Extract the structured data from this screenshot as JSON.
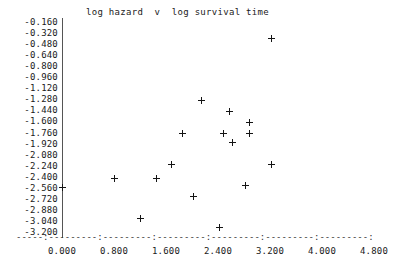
{
  "chart_data": {
    "type": "scatter",
    "title": "log hazard  v  log survival time",
    "xlabel": "",
    "ylabel": "",
    "xlim": [
      0.0,
      4.8
    ],
    "ylim": [
      -3.2,
      -0.16
    ],
    "grid": false,
    "legend": null,
    "marker": "plus",
    "x_ticks": [
      "0.000",
      "0.800",
      "1.600",
      "2.400",
      "3.200",
      "4.000",
      "4.800"
    ],
    "x_tick_values": [
      0.0,
      0.8,
      1.6,
      2.4,
      3.2,
      4.0,
      4.8
    ],
    "y_ticks": [
      "-0.160",
      "-0.320",
      "-0.480",
      "-0.640",
      "-0.800",
      "-0.960",
      "-1.120",
      "-1.280",
      "-1.440",
      "-1.600",
      "-1.760",
      "-1.920",
      "-2.080",
      "-2.240",
      "-2.400",
      "-2.560",
      "-2.720",
      "-2.880",
      "-3.040",
      "-3.200"
    ],
    "y_tick_values": [
      -0.16,
      -0.32,
      -0.48,
      -0.64,
      -0.8,
      -0.96,
      -1.12,
      -1.28,
      -1.44,
      -1.6,
      -1.76,
      -1.92,
      -2.08,
      -2.24,
      -2.4,
      -2.56,
      -2.72,
      -2.88,
      -3.04,
      -3.2
    ],
    "points": [
      {
        "x": 3.23,
        "y": -0.4
      },
      {
        "x": 2.15,
        "y": -1.3
      },
      {
        "x": 2.57,
        "y": -1.46
      },
      {
        "x": 2.89,
        "y": -1.61
      },
      {
        "x": 1.85,
        "y": -1.78
      },
      {
        "x": 2.49,
        "y": -1.78
      },
      {
        "x": 2.89,
        "y": -1.77
      },
      {
        "x": 2.63,
        "y": -1.91
      },
      {
        "x": 1.68,
        "y": -2.23
      },
      {
        "x": 3.23,
        "y": -2.23
      },
      {
        "x": 0.8,
        "y": -2.42
      },
      {
        "x": 1.45,
        "y": -2.42
      },
      {
        "x": 0.0,
        "y": -2.56
      },
      {
        "x": 2.83,
        "y": -2.53
      },
      {
        "x": 2.02,
        "y": -2.69
      },
      {
        "x": 1.2,
        "y": -3.01
      },
      {
        "x": 2.43,
        "y": -3.13
      }
    ]
  },
  "axis": {
    "x_axis_dash_string": "-----:---------:---------:---------:---------:---------:---------:"
  }
}
